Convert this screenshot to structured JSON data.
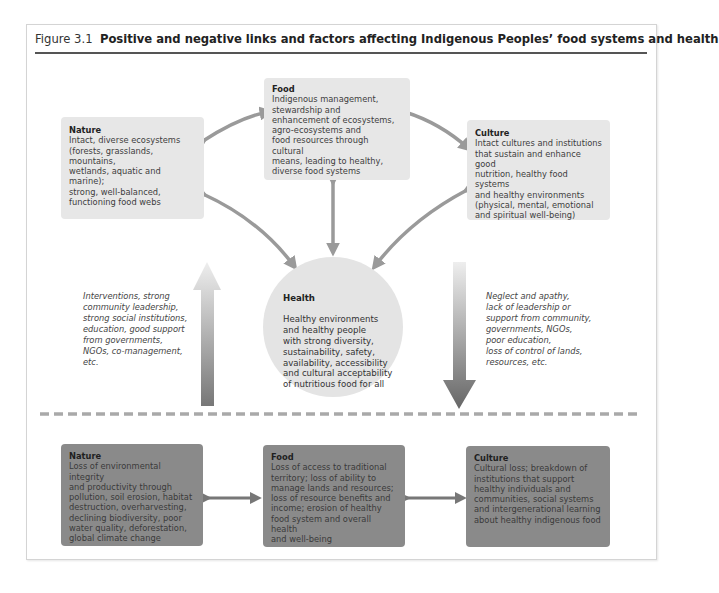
{
  "page_fragment_text": "…is at high risk as a group approach in this program in the text on page … …",
  "figure": {
    "number": "Figure 3.1",
    "title": "Positive and negative links and factors affecting Indigenous Peoples’ food systems and health"
  },
  "positive": {
    "nature": {
      "heading": "Nature",
      "body": "Intact, diverse ecosystems\n(forests, grasslands, mountains,\nwetlands, aquatic and marine);\nstrong, well-balanced,\nfunctioning food webs"
    },
    "food": {
      "heading": "Food",
      "body": "Indigenous management,\nstewardship and\nenhancement of ecosystems,\nagro-ecosystems and\nfood resources through cultural\nmeans, leading to healthy,\ndiverse food systems"
    },
    "culture": {
      "heading": "Culture",
      "body": "Intact cultures and institutions\nthat sustain and enhance good\nnutrition, healthy food systems\nand healthy environments\n(physical, mental, emotional\nand spiritual well-being)"
    },
    "health": {
      "heading": "Health",
      "body": "Healthy environments\nand healthy people\nwith strong diversity,\nsustainability, safety,\navailability, accessibility\nand cultural acceptability\nof nutritious food for all"
    }
  },
  "factors": {
    "upward": "Interventions, strong\ncommunity leadership,\nstrong social institutions,\neducation, good support\nfrom governments,\nNGOs, co-management,\netc.",
    "downward": "Neglect and apathy,\nlack of leadership or\nsupport from community,\ngovernments, NGOs,\npoor education,\nloss of control of lands,\nresources, etc."
  },
  "negative": {
    "nature": {
      "heading": "Nature",
      "body": "Loss of environmental integrity\nand productivity through\npollution, soil erosion, habitat\ndestruction, overharvesting,\ndeclining biodiversity, poor\nwater quality, deforestation,\nglobal climate change"
    },
    "food": {
      "heading": "Food",
      "body": "Loss of access to traditional\nterritory; loss of ability to\nmanage lands and resources;\nloss of resource benefits and\nincome; erosion of healthy\nfood system and overall health\nand well-being"
    },
    "culture": {
      "heading": "Culture",
      "body": "Cultural loss; breakdown of\ninstitutions that support\nhealthy individuals and\ncommunities, social systems\nand intergenerational learning\nabout healthy indigenous food"
    }
  },
  "colors": {
    "positive_box": "#e7e7e7",
    "negative_box": "#8a8a8a",
    "arrow": "#9a9a9a",
    "divider": "#a9a9a9"
  }
}
